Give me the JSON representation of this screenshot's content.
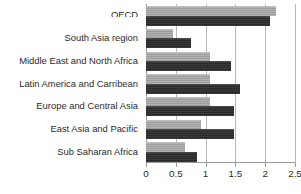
{
  "chart_data": {
    "type": "bar",
    "orientation": "horizontal",
    "title": "",
    "subtitle": "",
    "xlabel": "",
    "ylabel": "",
    "xlim": [
      0,
      2.5
    ],
    "xticks": [
      "0",
      "0.5",
      "1",
      "1.5",
      "2",
      "2.5"
    ],
    "xtick_values": [
      0,
      0.5,
      1,
      1.5,
      2,
      2.5
    ],
    "grid": true,
    "legend": "none",
    "categories": [
      "OECD",
      "South Asia region",
      "Middle East and North Africa",
      "Latin America and Carribean",
      "Europe and Central Asia",
      "East Asia and Pacific",
      "Sub Saharan Africa"
    ],
    "category_clipped": [
      true,
      false,
      false,
      false,
      false,
      false,
      false
    ],
    "series": [
      {
        "name": "series-light",
        "color": "#a8a8a8",
        "values": [
          2.18,
          0.45,
          1.08,
          1.08,
          1.08,
          0.93,
          0.65
        ]
      },
      {
        "name": "series-dark",
        "color": "#303030",
        "values": [
          2.08,
          0.75,
          1.42,
          1.57,
          1.48,
          1.48,
          0.85
        ]
      }
    ]
  },
  "colors": {
    "background": "#ffffff",
    "grid": "#b9b9b9",
    "axis": "#9a9a9a",
    "text": "#2b2b2b",
    "series_light": "#a8a8a8",
    "series_dark": "#303030"
  }
}
